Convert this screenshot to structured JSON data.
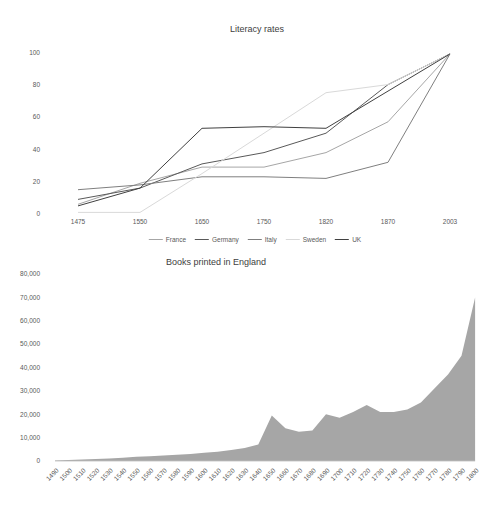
{
  "literacy_chart": {
    "title": "Literacy rates"
  },
  "books_chart": {
    "title": "Books printed in England"
  },
  "chart_data": [
    {
      "type": "line",
      "title": "Literacy rates",
      "categories": [
        "1475",
        "1550",
        "1650",
        "1750",
        "1820",
        "1870",
        "2003"
      ],
      "series": [
        {
          "name": "France",
          "color": "#a6a6a6",
          "values": [
            6,
            19,
            29,
            29,
            38,
            57,
            99
          ]
        },
        {
          "name": "Germany",
          "color": "#595959",
          "values": [
            9,
            16,
            31,
            38,
            50,
            80,
            99
          ]
        },
        {
          "name": "Italy",
          "color": "#7f7f7f",
          "values": [
            15,
            18,
            23,
            23,
            22,
            32,
            99
          ]
        },
        {
          "name": "Sweden",
          "color": "#d9d9d9",
          "values": [
            1,
            1,
            25,
            50,
            75,
            80,
            99
          ]
        },
        {
          "name": "UK",
          "color": "#404040",
          "values": [
            5,
            16,
            53,
            54,
            53,
            76,
            99
          ]
        }
      ],
      "ylim": [
        0,
        100
      ],
      "yticks": [
        0,
        20,
        40,
        60,
        80,
        100
      ],
      "ytick_labels": [
        "0",
        "20",
        "40",
        "60",
        "80",
        "100"
      ],
      "legend_position": "bottom",
      "grid": false
    },
    {
      "type": "area",
      "title": "Books printed in England",
      "color": "#a6a6a6",
      "categories": [
        "1490",
        "1500",
        "1510",
        "1520",
        "1530",
        "1540",
        "1550",
        "1560",
        "1570",
        "1580",
        "1590",
        "1600",
        "1610",
        "1620",
        "1630",
        "1640",
        "1650",
        "1660",
        "1670",
        "1680",
        "1690",
        "1700",
        "1710",
        "1720",
        "1730",
        "1740",
        "1750",
        "1760",
        "1770",
        "1780",
        "1790",
        "1800"
      ],
      "values": [
        200,
        400,
        600,
        900,
        1100,
        1400,
        1800,
        2000,
        2300,
        2700,
        3000,
        3500,
        4000,
        4700,
        5500,
        7000,
        19500,
        14000,
        12500,
        13000,
        20000,
        18500,
        21000,
        24000,
        21000,
        21000,
        22000,
        25000,
        31000,
        37000,
        45000,
        70000
      ],
      "ylim": [
        0,
        80000
      ],
      "yticks": [
        0,
        10000,
        20000,
        30000,
        40000,
        50000,
        60000,
        70000,
        80000
      ],
      "ytick_labels": [
        "0",
        "10,000",
        "20,000",
        "30,000",
        "40,000",
        "50,000",
        "60,000",
        "70,000",
        "80,000"
      ],
      "axis_color": "#bfbfbf",
      "grid": false
    }
  ]
}
